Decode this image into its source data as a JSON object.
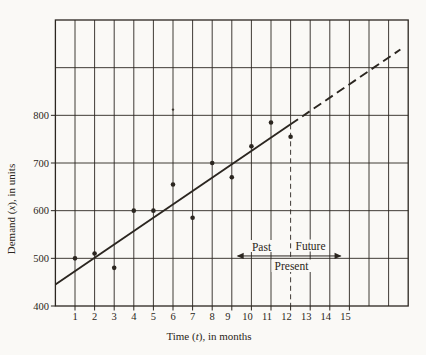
{
  "colors": {
    "ink": "#2b2620",
    "paper": "#faf9f6"
  },
  "chart_data": {
    "type": "scatter",
    "title": "",
    "xlabel_parts": [
      "Time (",
      "t",
      "), in months"
    ],
    "ylabel_parts": [
      "Demand (",
      "x",
      "), in units"
    ],
    "x_tick_labels": [
      "1",
      "2",
      "3",
      "4",
      "5",
      "6",
      "7",
      "8",
      "9",
      "10",
      "11",
      "12",
      "13",
      "14",
      "15"
    ],
    "y_tick_labels": [
      "400",
      "500",
      "600",
      "700",
      "800"
    ],
    "xlim": [
      0,
      18
    ],
    "ylim": [
      400,
      1000
    ],
    "x_grid_step": 1,
    "y_grid_step": 100,
    "grid": "on",
    "legend": "none",
    "points": [
      [
        1,
        500
      ],
      [
        2,
        510
      ],
      [
        3,
        480
      ],
      [
        4,
        600
      ],
      [
        5,
        600
      ],
      [
        6,
        655
      ],
      [
        7,
        585
      ],
      [
        8,
        700
      ],
      [
        9,
        670
      ],
      [
        10,
        735
      ],
      [
        11,
        785
      ],
      [
        12,
        755
      ]
    ],
    "trend_line": {
      "t_start": 0,
      "value_start": 445,
      "t_dash_start": 12,
      "t_end": 17.6,
      "value_end": 938,
      "future_style": "dashed"
    },
    "present_divider_t": 12,
    "timeline_annotation": {
      "past_label": "Past",
      "future_label": "Future",
      "present_label": "Present",
      "arrow_value": 505,
      "arrow_t_start": 9.25,
      "arrow_t_end": 14.6
    },
    "stray_mark": {
      "t": 6,
      "value": 812
    }
  }
}
